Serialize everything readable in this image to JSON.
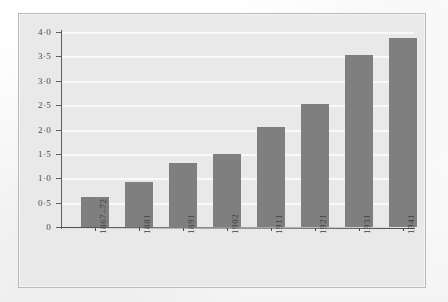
{
  "figure": {
    "background_color": "#e9e9e9",
    "frame_color": "#b9b9b9",
    "bar_color": "#7f7f80",
    "gridline_color": "#fbfbfb",
    "axis_color": "#4a4a4a"
  },
  "chart_data": {
    "type": "bar",
    "title": "",
    "xlabel": "",
    "ylabel": "",
    "categories": [
      "1867–72",
      "1881",
      "1891",
      "1902",
      "1911",
      "1921",
      "1931",
      "1941"
    ],
    "values": [
      0.62,
      0.92,
      1.32,
      1.49,
      2.06,
      2.52,
      3.53,
      3.88
    ],
    "ylim": [
      0,
      4.0
    ],
    "yticks": [
      0,
      0.5,
      1.0,
      1.5,
      2.0,
      2.5,
      3.0,
      3.5,
      4.0
    ],
    "ytick_labels": [
      "0",
      "0·5",
      "1·0",
      "1·5",
      "2·0",
      "2·5",
      "3·0",
      "3·5",
      "4·0"
    ],
    "grid": true,
    "legend": null,
    "legend_position": "none",
    "annotations": []
  }
}
